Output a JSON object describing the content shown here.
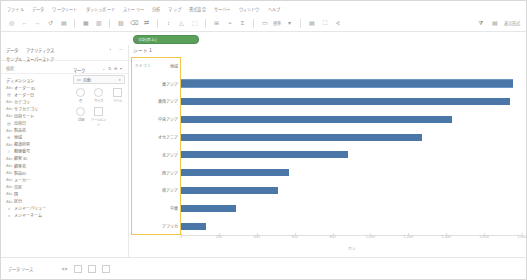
{
  "app": {
    "name": "Tableau Desktop",
    "locale": "ja"
  },
  "menubar": {
    "items": [
      "ファイル",
      "データ",
      "ワークシート",
      "ダッシュボード",
      "ストーリー",
      "分析",
      "マップ",
      "書式設定",
      "サーバー",
      "ウィンドウ",
      "ヘルプ"
    ]
  },
  "toolbar": {
    "icons": [
      "tableau-logo-icon",
      "back-icon",
      "forward-icon",
      "undo-icon",
      "save-icon",
      "new-data-source-icon",
      "new-worksheet-icon",
      "duplicate-icon",
      "clear-sheet-icon",
      "swap-axes-icon",
      "sort-ascending-icon",
      "sort-descending-icon",
      "highlight-icon",
      "group-icon",
      "labels-icon",
      "fit-icon",
      "fix-axes-icon",
      "presentation-icon",
      "share-icon"
    ],
    "fit_label": "標準",
    "right": {
      "filter_icon": "filter-icon",
      "showme_label": "表示形式",
      "showme_icon": "show-me-icon"
    }
  },
  "shelves": {
    "columns": {
      "label": "列",
      "pills": [
        {
          "text": "合計(売上)",
          "type": "measure"
        }
      ]
    },
    "rows": {
      "label": "行",
      "pills": [
        {
          "text": "カテゴリ",
          "type": "dimension"
        },
        {
          "text": "地域",
          "type": "dimension"
        }
      ]
    }
  },
  "left_pane": {
    "tabs": [
      "データ",
      "アナリティクス"
    ],
    "menu_icon": "chevron-icon",
    "search_placeholder": "検索",
    "connection": "サンプル - スーパーストア",
    "dimensions_title": "ディメンション",
    "search_icon": "search-icon",
    "sort_icon": "sort-icon",
    "fields": [
      {
        "icon": "abc",
        "name": "オーダー ID"
      },
      {
        "icon": "cal",
        "name": "オーダー日"
      },
      {
        "icon": "abc",
        "name": "カテゴリ"
      },
      {
        "icon": "abc",
        "name": "サブカテゴリ"
      },
      {
        "icon": "abc",
        "name": "出荷モード"
      },
      {
        "icon": "cal",
        "name": "出荷日"
      },
      {
        "icon": "abc",
        "name": "製品名"
      },
      {
        "icon": "geo",
        "name": "地域"
      },
      {
        "icon": "abc",
        "name": "都道府県"
      },
      {
        "icon": "hash",
        "name": "郵便番号"
      },
      {
        "icon": "abc",
        "name": "顧客 ID"
      },
      {
        "icon": "abc",
        "name": "顧客名"
      },
      {
        "icon": "abc",
        "name": "製品ID"
      },
      {
        "icon": "abc",
        "name": "メーカー"
      },
      {
        "icon": "abc",
        "name": "市区"
      },
      {
        "icon": "abc",
        "name": "国"
      },
      {
        "icon": "abc",
        "name": "区分"
      },
      {
        "icon": "calc",
        "name": "メジャーバリュー"
      },
      {
        "icon": "calc",
        "name": "メジャーネーム"
      }
    ]
  },
  "marks": {
    "title": "マーク",
    "type": "自動",
    "buttons": [
      {
        "name": "color",
        "label": "色",
        "icon": "color-icon"
      },
      {
        "name": "size",
        "label": "サイズ",
        "icon": "size-icon"
      },
      {
        "name": "label",
        "label": "ラベル",
        "icon": "label-icon"
      },
      {
        "name": "detail",
        "label": "詳細",
        "icon": "detail-icon"
      },
      {
        "name": "tooltip",
        "label": "ツールヒント",
        "icon": "tooltip-icon"
      }
    ]
  },
  "worksheet": {
    "title": "シート 1"
  },
  "status_bar": {
    "data_source_tab": "データ ソース",
    "tab_icons": [
      "new-worksheet-icon",
      "new-dashboard-icon",
      "new-story-icon"
    ],
    "sheet_tabs": []
  },
  "colors": {
    "bar": "#4a77a8",
    "highlight_box": "#f0c64c",
    "measure_pill": "#5aa05a",
    "dimension_pill": "#5ba3c9"
  },
  "chart_data": {
    "type": "bar",
    "orientation": "horizontal",
    "title": "シート 1",
    "xlabel": "売上",
    "ylabel": "",
    "xlim": [
      0,
      1800
    ],
    "grid": false,
    "legend": false,
    "categories": [
      "家電",
      "事務用品",
      "事務用品",
      "家具",
      "家具",
      "事務用品",
      "家電",
      "家具",
      "事務用品"
    ],
    "row_headers": [
      {
        "group": "カテゴリ",
        "label": "地域"
      },
      {
        "group": "",
        "label": "東アジア"
      },
      {
        "group": "",
        "label": "東南アジア"
      },
      {
        "group": "",
        "label": "中央アジア"
      },
      {
        "group": "",
        "label": "オセアニア"
      },
      {
        "group": "",
        "label": "北アジア"
      },
      {
        "group": "",
        "label": "西アジア"
      },
      {
        "group": "",
        "label": "南アジア"
      },
      {
        "group": "",
        "label": "中東"
      },
      {
        "group": "",
        "label": "アフリカ"
      }
    ],
    "values": [
      1750,
      1735,
      1430,
      1270,
      880,
      570,
      510,
      290,
      130
    ],
    "ticks": [
      0,
      200,
      400,
      600,
      800,
      1000,
      1200,
      1400,
      1600,
      1800
    ],
    "tick_labels": [
      "0",
      "200",
      "400",
      "600",
      "800",
      "1,000",
      "1,200",
      "1,400",
      "1,600",
      "1,800"
    ]
  }
}
